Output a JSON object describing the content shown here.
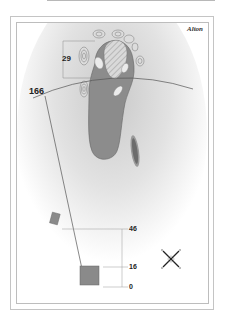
{
  "hole": {
    "course_name": "Alton"
  },
  "distances": {
    "green_depth": "29",
    "to_green_carry": "166",
    "tee_marker_far": "46",
    "tee_marker_mid": "16",
    "tee_marker_zero": "0"
  },
  "icons": {
    "compass": "compass-rose-icon"
  },
  "colors": {
    "fairway": "#8c8c8c",
    "green": "#cfcfcf",
    "rough_shade": "#d8d8d8",
    "bunker": "#ebebeb",
    "tee": "#8a8a8a",
    "line": "#555555",
    "frame": "#c4c4c4"
  }
}
